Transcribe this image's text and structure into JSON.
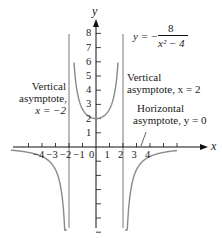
{
  "chart_data": {
    "type": "line",
    "title": "",
    "equation": {
      "lhs": "y = −",
      "numerator": "8",
      "denominator": "x² − 4"
    },
    "xlabel": "x",
    "ylabel": "y",
    "xlim": [
      -6,
      8
    ],
    "ylim": [
      -6,
      9
    ],
    "grid": false,
    "legend": null,
    "x_ticks": [
      -5,
      -4,
      -3,
      -2,
      -1,
      0,
      1,
      2,
      3,
      4,
      5,
      6
    ],
    "x_tick_labels": [
      "-4",
      "-3",
      "-2",
      "-1",
      "0",
      "1",
      "2",
      "3",
      "4"
    ],
    "y_ticks": [
      -6,
      -5,
      -4,
      -3,
      -2,
      -1,
      1,
      2,
      3,
      4,
      5,
      6,
      7,
      8
    ],
    "y_tick_labels": [
      "1",
      "2",
      "3",
      "4",
      "5",
      "6",
      "7",
      "8"
    ],
    "series": [
      {
        "name": "y = -8/(x^2 - 4)",
        "function": "-8/(x^2-4)",
        "branches": [
          {
            "domain": [
              -6,
              -2
            ],
            "points": [
              [
                -6,
                -0.25
              ],
              [
                -5,
                -0.38
              ],
              [
                -4,
                -0.67
              ],
              [
                -3,
                -1.6
              ],
              [
                -2.5,
                -3.56
              ],
              [
                -2.3,
                -6.2
              ]
            ]
          },
          {
            "domain": [
              -2,
              2
            ],
            "points": [
              [
                -1.6,
                5.56
              ],
              [
                -1.5,
                4.57
              ],
              [
                -1,
                2.67
              ],
              [
                0,
                2
              ],
              [
                1,
                2.67
              ],
              [
                1.5,
                4.57
              ],
              [
                1.6,
                5.56
              ]
            ]
          },
          {
            "domain": [
              2,
              6
            ],
            "points": [
              [
                2.3,
                -6.2
              ],
              [
                2.5,
                -3.56
              ],
              [
                3,
                -1.6
              ],
              [
                4,
                -0.67
              ],
              [
                5,
                -0.38
              ],
              [
                6,
                -0.25
              ]
            ]
          }
        ]
      }
    ],
    "asymptotes": [
      {
        "type": "vertical",
        "value": -2,
        "label": [
          "Vertical",
          "asymptote,",
          "x = −2"
        ]
      },
      {
        "type": "vertical",
        "value": 2,
        "label": [
          "Vertical",
          "asymptote, x = 2"
        ]
      },
      {
        "type": "horizontal",
        "value": 0,
        "label": [
          "Horizontal",
          "asymptote, y = 0"
        ]
      }
    ]
  },
  "labels": {
    "x_axis": "x",
    "y_axis": "y",
    "eq_lhs": "y = −",
    "eq_num": "8",
    "eq_den": "x² − 4",
    "va_left_1": "Vertical",
    "va_left_2": "asymptote,",
    "va_left_3": "x = −2",
    "va_right_1": "Vertical",
    "va_right_2": "asymptote, x = 2",
    "ha_1": "Horizontal",
    "ha_2": "asymptote, y = 0"
  }
}
